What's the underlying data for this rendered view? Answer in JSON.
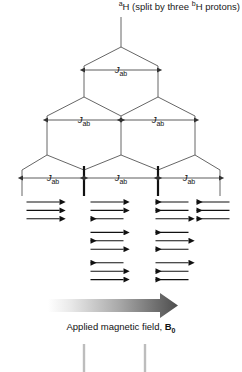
{
  "diagram": {
    "title": {
      "pre_sup": "a",
      "mid": "H (split by three ",
      "post_sup": "b",
      "tail": "H protons)"
    },
    "coupling_label": {
      "symbol": "J",
      "subscript": "ab"
    },
    "field_caption": {
      "text": "Applied magnetic field, ",
      "symbol": "B",
      "subscript": "0"
    },
    "colors": {
      "line": "#555555",
      "arrow": "#111111",
      "peak": "#bdbdbd",
      "gradient_start": "#ffffff",
      "gradient_end": "#4d4d4d"
    },
    "tree": {
      "root_x": 121,
      "levels": [
        {
          "name": "level-0-singlet",
          "positions": [
            121
          ]
        },
        {
          "name": "level-1-doublet",
          "positions": [
            84,
            158
          ]
        },
        {
          "name": "level-2-triplet",
          "positions": [
            47,
            121,
            195
          ]
        },
        {
          "name": "level-3-quartet",
          "positions": [
            22,
            84,
            158,
            220
          ]
        }
      ],
      "intensities": [
        1,
        3,
        3,
        1
      ]
    },
    "j_labels": [
      {
        "id": "j-level1",
        "x": 121,
        "y": 70,
        "span": [
          84,
          158
        ]
      },
      {
        "id": "j-level2-left",
        "x": 84,
        "y": 120,
        "span": [
          47,
          121
        ]
      },
      {
        "id": "j-level2-right",
        "x": 158,
        "y": 120,
        "span": [
          121,
          195
        ]
      },
      {
        "id": "j-level3-left",
        "x": 53,
        "y": 178,
        "span": [
          22,
          84
        ]
      },
      {
        "id": "j-level3-mid",
        "x": 121,
        "y": 178,
        "span": [
          84,
          158
        ]
      },
      {
        "id": "j-level3-right",
        "x": 189,
        "y": 178,
        "span": [
          158,
          220
        ]
      }
    ],
    "spin_states": [
      {
        "group": "quartet-line-1",
        "center_x": 43,
        "multiplicity": 1,
        "sets": [
          {
            "arrows": [
              "right",
              "right",
              "right"
            ]
          }
        ]
      },
      {
        "group": "quartet-line-2",
        "center_x": 107,
        "multiplicity": 3,
        "sets": [
          {
            "arrows": [
              "right",
              "right",
              "left"
            ]
          },
          {
            "arrows": [
              "right",
              "left",
              "right"
            ]
          },
          {
            "arrows": [
              "left",
              "right",
              "right"
            ]
          }
        ]
      },
      {
        "group": "quartet-line-3",
        "center_x": 172,
        "multiplicity": 3,
        "sets": [
          {
            "arrows": [
              "left",
              "left",
              "right"
            ]
          },
          {
            "arrows": [
              "left",
              "right",
              "left"
            ]
          },
          {
            "arrows": [
              "right",
              "left",
              "left"
            ]
          }
        ]
      },
      {
        "group": "quartet-line-4",
        "center_x": 213,
        "multiplicity": 1,
        "sets": [
          {
            "arrows": [
              "left",
              "left",
              "left"
            ]
          }
        ]
      }
    ],
    "field_arrow": {
      "x1": 48,
      "x2": 178,
      "y": 305,
      "thickness": 14
    },
    "bottom_peaks": [
      {
        "x": 84,
        "top": 344
      },
      {
        "x": 145,
        "top": 344
      }
    ]
  }
}
